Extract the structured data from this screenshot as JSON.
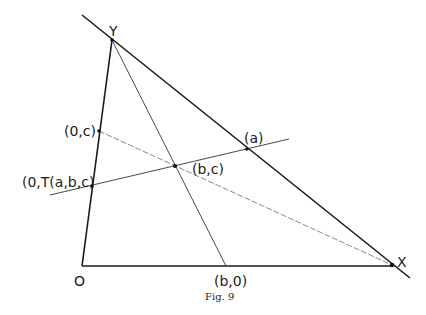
{
  "figure": {
    "caption": "Fig. 9",
    "labels": {
      "Y": "Y",
      "X": "X",
      "O": "O",
      "zero_c": "(0,c)",
      "T": "(0,T(a,b,c)",
      "b_c": "(b,c)",
      "a": "(a)",
      "b_0": "(b,0)"
    }
  },
  "diagram_data": {
    "points": [
      {
        "id": "Y",
        "x": 112,
        "y": 40
      },
      {
        "id": "X",
        "x": 392,
        "y": 265
      },
      {
        "id": "O",
        "x": 82,
        "y": 266
      },
      {
        "id": "(0,c)",
        "x": 99,
        "y": 131
      },
      {
        "id": "(0,T(a,b,c)",
        "x": 92,
        "y": 186
      },
      {
        "id": "(b,c)",
        "x": 175,
        "y": 166
      },
      {
        "id": "(a)",
        "x": 247,
        "y": 149
      },
      {
        "id": "(b,0)",
        "x": 226,
        "y": 266
      }
    ],
    "lines": [
      {
        "from": "extended",
        "through": [
          "Y",
          "(a)",
          "X"
        ],
        "style": "bold"
      },
      {
        "from": "O",
        "to": "Y",
        "style": "bold"
      },
      {
        "from": "O",
        "to": "X",
        "style": "bold"
      },
      {
        "through": [
          "(0,T(a,b,c)",
          "(b,c)",
          "(a)"
        ],
        "style": "solid-transversal"
      },
      {
        "from": "Y",
        "to": "(b,0)",
        "style": "thin"
      },
      {
        "from": "(0,c)",
        "to": "X",
        "style": "thin-dashed"
      }
    ]
  }
}
